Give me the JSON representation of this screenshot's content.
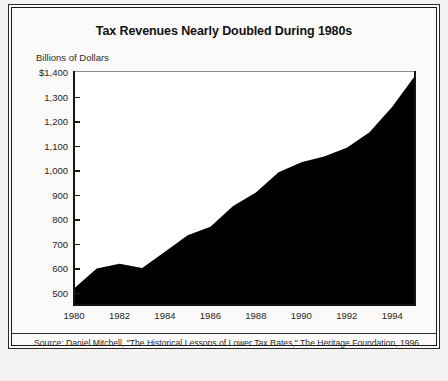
{
  "figure": {
    "title": "Tax Revenues Nearly Doubled During 1980s",
    "axis_unit_label": "Billions of Dollars",
    "source_note": "Source: Daniel Mitchell, \"The Historical Lessons of Lower Tax Rates,\" The Heritage Foundation, 1996.",
    "colors": {
      "area_fill": "#000000",
      "plot_background": "#ffffff",
      "page_background": "#fbfaf8",
      "frame": "#1a1a1a",
      "text": "#1a1a1a"
    }
  },
  "chart_data": {
    "type": "area",
    "title": "Tax Revenues Nearly Doubled During 1980s",
    "subtitle": "",
    "xlabel": "",
    "ylabel": "Billions of Dollars",
    "grid": false,
    "legend": null,
    "xlim": [
      1980,
      1995
    ],
    "ylim": [
      450,
      1400
    ],
    "y_tick_labels": [
      "$1,400",
      "1,300",
      "1,200",
      "1,100",
      "1,000",
      "900",
      "800",
      "700",
      "600",
      "500"
    ],
    "y_ticks": [
      1400,
      1300,
      1200,
      1100,
      1000,
      900,
      800,
      700,
      600,
      500
    ],
    "x_tick_labels": [
      "1980",
      "1982",
      "1984",
      "1986",
      "1988",
      "1990",
      "1992",
      "1994"
    ],
    "x_ticks": [
      1980,
      1982,
      1984,
      1986,
      1988,
      1990,
      1992,
      1994
    ],
    "x": [
      1980,
      1981,
      1982,
      1983,
      1984,
      1985,
      1986,
      1987,
      1988,
      1989,
      1990,
      1991,
      1992,
      1993,
      1994,
      1995
    ],
    "values": [
      517,
      599,
      618,
      601,
      667,
      734,
      769,
      854,
      909,
      991,
      1032,
      1055,
      1091,
      1154,
      1258,
      1385
    ],
    "series": [
      {
        "name": "Total federal tax revenues",
        "values": [
          517,
          599,
          618,
          601,
          667,
          734,
          769,
          854,
          909,
          991,
          1032,
          1055,
          1091,
          1154,
          1258,
          1385
        ]
      }
    ]
  }
}
